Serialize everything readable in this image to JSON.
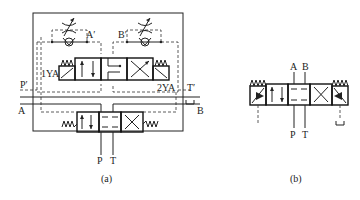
{
  "figure_a": {
    "caption": "(a)",
    "labels": {
      "a_prime": "A′",
      "b_prime": "B′",
      "p_prime": "P′",
      "t_prime": "T′",
      "sol1": "1YA",
      "sol2": "2YA",
      "a": "A",
      "b": "B",
      "p": "P",
      "t": "T"
    }
  },
  "figure_b": {
    "caption": "(b)",
    "labels": {
      "a": "A",
      "b": "B",
      "p": "P",
      "t": "T"
    }
  }
}
